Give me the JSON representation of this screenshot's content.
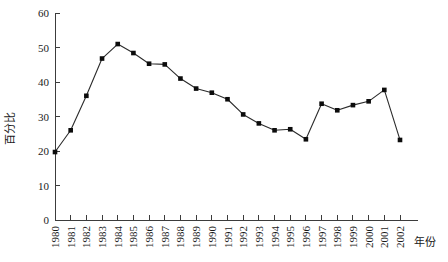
{
  "chart_data": {
    "type": "line",
    "title": "",
    "xlabel": "年份",
    "ylabel": "百分比",
    "xlim": [
      1979.5,
      2002.8
    ],
    "ylim": [
      0,
      60
    ],
    "yticks": [
      0,
      10,
      20,
      30,
      40,
      50,
      60
    ],
    "grid": false,
    "legend": "none",
    "marker": "square",
    "line_color": "#2b2b2b",
    "marker_color": "#0c0c0c",
    "categories": [
      "1980",
      "1981",
      "1982",
      "1983",
      "1984",
      "1985",
      "1986",
      "1987",
      "1988",
      "1989",
      "1990",
      "1991",
      "1992",
      "1993",
      "1994",
      "1995",
      "1996",
      "1997",
      "1998",
      "1999",
      "2000",
      "2001",
      "2002"
    ],
    "values": [
      19.7,
      26.0,
      36.0,
      46.8,
      51.0,
      48.4,
      45.3,
      45.1,
      41.0,
      38.1,
      36.9,
      35.0,
      30.6,
      28.0,
      26.0,
      26.3,
      23.4,
      33.7,
      31.8,
      33.3,
      34.4,
      37.7,
      23.2
    ]
  },
  "axes": {
    "y_tick_labels": [
      "0",
      "10",
      "20",
      "30",
      "40",
      "50",
      "60"
    ],
    "y_axis_title": "百分比",
    "x_axis_title": "年份",
    "x_tick_labels": [
      "1980",
      "1981",
      "1982",
      "1983",
      "1984",
      "1985",
      "1986",
      "1987",
      "1988",
      "1989",
      "1990",
      "1991",
      "1992",
      "1993",
      "1994",
      "1995",
      "1996",
      "1997",
      "1998",
      "1999",
      "2000",
      "2001",
      "2002"
    ]
  }
}
